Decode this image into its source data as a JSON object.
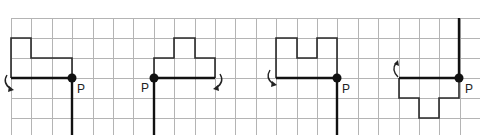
{
  "figure": {
    "point_label": "P",
    "grid": {
      "origin_x": 11,
      "origin_y": 18,
      "cell": 20.4,
      "cols": 23,
      "rows": 6
    },
    "colors": {
      "grid": "#b4b4b4",
      "shape": "#2a2a2a",
      "axis": "#111111"
    },
    "panels": [
      {
        "id": 1,
        "point_label": "P",
        "rotation_arrow": "left-clockwise",
        "axis": "down"
      },
      {
        "id": 2,
        "point_label": "P",
        "rotation_arrow": "right-clockwise",
        "axis": "down"
      },
      {
        "id": 3,
        "point_label": "P",
        "rotation_arrow": "left-counterclockwise",
        "axis": "down"
      },
      {
        "id": 4,
        "point_label": "P",
        "rotation_arrow": "left-up",
        "axis": "up"
      }
    ]
  }
}
